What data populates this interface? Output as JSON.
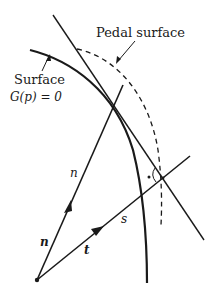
{
  "diagram": {
    "labels": {
      "pedal_surface": "Pedal surface",
      "surface": "Surface",
      "surface_eq": "G(p) = 0",
      "n_upper": "n",
      "n_lower": "n",
      "t": "t",
      "s": "s"
    },
    "colors": {
      "ink": "#1a1a1a",
      "background": "#ffffff"
    },
    "elements": [
      {
        "name": "surface-curve",
        "style": "solid-thick"
      },
      {
        "name": "pedal-surface-curve",
        "style": "dashed"
      },
      {
        "name": "tangent-line",
        "style": "solid"
      },
      {
        "name": "normal-ray-n",
        "style": "solid",
        "arrow": true
      },
      {
        "name": "ray-t",
        "style": "solid",
        "arrow": true
      },
      {
        "name": "right-angle-marker",
        "style": "arc-with-dot"
      }
    ]
  }
}
